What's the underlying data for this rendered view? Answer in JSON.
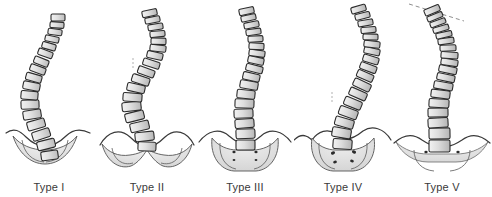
{
  "figure": {
    "background_color": "#ffffff",
    "width": 492,
    "height": 197
  },
  "style": {
    "vertebra_fill_light": "#e9e9e9",
    "vertebra_fill_mid": "#d2d2d2",
    "vertebra_fill_dark": "#b9b9b9",
    "vertebra_stroke": "#2b2b2b",
    "pelvis_fill": "#e3e3e3",
    "pelvis_stroke": "#3a3a3a",
    "foramen_fill": "#2b2b2b",
    "dashed_marker": "#9a9a9a",
    "label_color": "#3a3a3a"
  },
  "panels": [
    {
      "id": "type-1",
      "label": "Type I",
      "x": 0,
      "curve_description": "Long smooth sigmoid spine, apex deviated left, simple rounded sacrum",
      "vertebra_count": 17,
      "pelvis": {
        "style": "rounded-dome",
        "foramina": 0,
        "iliac_wings": "narrow-wavy"
      },
      "top_dashed_line": false,
      "dashed_markers": 0
    },
    {
      "id": "type-2",
      "label": "Type II",
      "x": 98,
      "curve_description": "S-shaped spine with pronounced mid-lumbar translation, broad winged pelvis",
      "vertebra_count": 17,
      "pelvis": {
        "style": "butterfly-wide",
        "foramina": 0,
        "iliac_wings": "broad-wavy"
      },
      "top_dashed_line": false,
      "dashed_markers": 2
    },
    {
      "id": "type-3",
      "label": "Type III",
      "x": 196,
      "curve_description": "Gentle curve with near-vertical lumbar column seated on sacrum",
      "vertebra_count": 17,
      "pelvis": {
        "style": "sacrum-with-foramina",
        "foramina": 4,
        "iliac_wings": "broad-wavy"
      },
      "top_dashed_line": false,
      "dashed_markers": 0
    },
    {
      "id": "type-4",
      "label": "Type IV",
      "x": 294,
      "curve_description": "Strongly right-deviated thoracic column descending obliquely onto sacrum",
      "vertebra_count": 17,
      "pelvis": {
        "style": "sacrum-with-large-foramina",
        "foramina": 4,
        "iliac_wings": "broad-wavy"
      },
      "top_dashed_line": false,
      "dashed_markers": 2
    },
    {
      "id": "type-5",
      "label": "Type V",
      "x": 392,
      "curve_description": "Sigmoid spine with obliquely tilted uppermost vertebra marked by dashed reference line",
      "vertebra_count": 18,
      "pelvis": {
        "style": "flat-wide-sacrum",
        "foramina": 2,
        "iliac_wings": "broad-flat-wavy"
      },
      "top_dashed_line": true,
      "dashed_markers": 0
    }
  ]
}
